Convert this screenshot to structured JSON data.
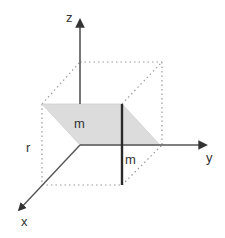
{
  "diagram": {
    "type": "3d-coordinate-axes",
    "axes": {
      "x": {
        "label": "x"
      },
      "y": {
        "label": "y"
      },
      "z": {
        "label": "z"
      }
    },
    "labels": {
      "plane_m": "m",
      "line_m": "m",
      "height_r": "r"
    },
    "colors": {
      "axis": "#555555",
      "arrowhead": "#333333",
      "plane_fill": "#dcdcdc",
      "thick_line": "#2a2a2a",
      "dotted_box": "#999999",
      "text": "#333333"
    }
  }
}
